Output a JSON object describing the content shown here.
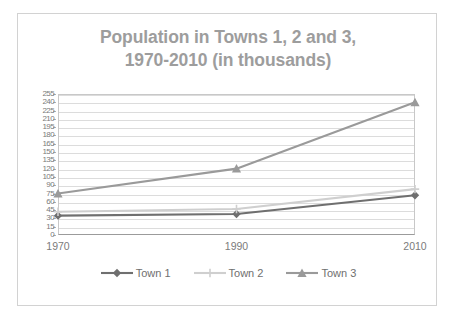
{
  "chart_data": {
    "type": "line",
    "title": "Population in Towns 1, 2 and 3, 1970-2010 (in thousands)",
    "title_lines": [
      "Population in Towns 1, 2 and 3,",
      "1970-2010 (in thousands)"
    ],
    "categories": [
      "1970",
      "1990",
      "2010"
    ],
    "x": [
      1970,
      1990,
      2010
    ],
    "series": [
      {
        "name": "Town 1",
        "values": [
          35,
          38,
          72
        ],
        "color": "#6f6f6f",
        "marker": "diamond"
      },
      {
        "name": "Town 2",
        "values": [
          42,
          47,
          83
        ],
        "color": "#cfcfcf",
        "marker": "plus"
      },
      {
        "name": "Town 3",
        "values": [
          75,
          120,
          240
        ],
        "color": "#9a9a9a",
        "marker": "triangle"
      }
    ],
    "xlabel": "",
    "ylabel": "",
    "ylim": [
      0,
      255
    ],
    "ytick_step": 15,
    "yticks": [
      0,
      15,
      30,
      45,
      60,
      75,
      90,
      105,
      120,
      135,
      150,
      165,
      180,
      195,
      210,
      225,
      240,
      255
    ],
    "ytick_labels": [
      "0",
      "15",
      "30",
      "45",
      "60",
      "75",
      "90",
      "105",
      "120",
      "135",
      "150",
      "165",
      "180",
      "195",
      "210",
      "225",
      "240",
      "255"
    ],
    "grid": true,
    "grid_axis": "y",
    "legend_position": "bottom",
    "legend_entries": [
      "Town 1",
      "Town 2",
      "Town 3"
    ]
  },
  "style": {
    "title_color": "#9d9d9d",
    "axis_text_color": "#7a7a7a",
    "gridline_color": "#dcdcdc",
    "plot_border_color": "#c8c8c8",
    "frame_border_color": "#d2d2d2",
    "background": "#ffffff"
  }
}
